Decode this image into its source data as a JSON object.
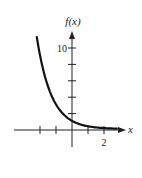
{
  "chart_data": {
    "type": "line",
    "title": "",
    "function": "f(x) = (1/3)^x",
    "xlabel": "x",
    "ylabel": "f(x)",
    "xlim": [
      -3.6,
      3.3
    ],
    "ylim": [
      -2,
      12
    ],
    "x_ticks": [
      -2,
      -1,
      0,
      1,
      2
    ],
    "x_tick_labels": [
      {
        "value": 2,
        "label": "2"
      }
    ],
    "y_ticks": [
      2,
      4,
      6,
      8,
      10
    ],
    "y_tick_labels": [
      {
        "value": 10,
        "label": "10"
      }
    ],
    "grid": false,
    "legend": null,
    "series": [
      {
        "name": "f(x)",
        "x": [
          -2.2,
          -2,
          -1.5,
          -1,
          -0.5,
          0,
          0.5,
          1,
          1.5,
          2,
          2.5,
          2.8
        ],
        "values": [
          11.2,
          9,
          5.2,
          3,
          1.73,
          1,
          0.58,
          0.33,
          0.19,
          0.11,
          0.06,
          0.05
        ]
      }
    ],
    "colors": {
      "axis": "#222222",
      "curve": "#111111",
      "background": "#ffffff"
    }
  },
  "labels": {
    "y_axis": "f(x)",
    "x_axis": "x",
    "y_tick_10": "10",
    "x_tick_2": "2"
  }
}
